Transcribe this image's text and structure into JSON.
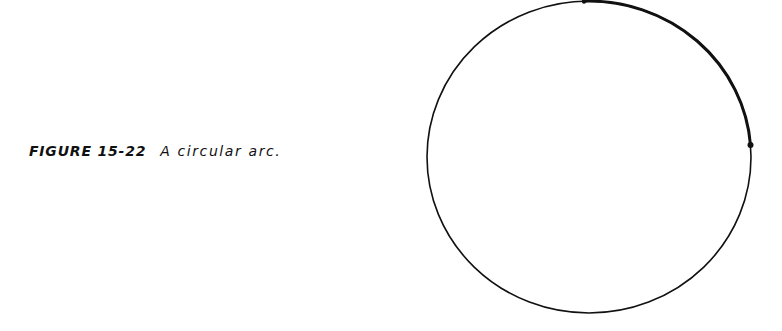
{
  "caption": {
    "label": "FIGURE 15-22",
    "text": "A circular arc."
  },
  "figure": {
    "shape": "circle",
    "center": [
      589,
      157
    ],
    "radius_x": 162,
    "radius_y": 157,
    "stroke_color": "#111111",
    "highlighted_arc": {
      "start_point": [
        584,
        1
      ],
      "end_point": [
        750,
        145
      ],
      "description": "thicker arc segment between two marked points"
    }
  }
}
